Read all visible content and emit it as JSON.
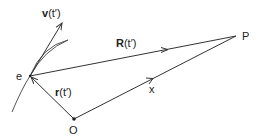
{
  "diagram": {
    "type": "vector-geometry",
    "points": {
      "e": {
        "label": "e",
        "x": 30,
        "y": 76
      },
      "P": {
        "label": "P",
        "x": 236,
        "y": 36
      },
      "O": {
        "label": "O",
        "x": 74,
        "y": 119
      }
    },
    "vectors": {
      "v": {
        "label_bold": "v",
        "label_rest": "(t′)",
        "from": "e",
        "tip": [
          62,
          22
        ]
      },
      "R": {
        "label_bold": "R",
        "label_rest": "(t′)",
        "from": "e",
        "to": "P"
      },
      "r": {
        "label_bold": "r",
        "label_rest": "(t′)",
        "from": "O",
        "to": "e"
      },
      "x": {
        "label": "x",
        "from": "O",
        "to": "P"
      }
    },
    "curve": {
      "description": "trajectory passing through e"
    },
    "colors": {
      "stroke": "#333333",
      "background": "#ffffff"
    }
  }
}
